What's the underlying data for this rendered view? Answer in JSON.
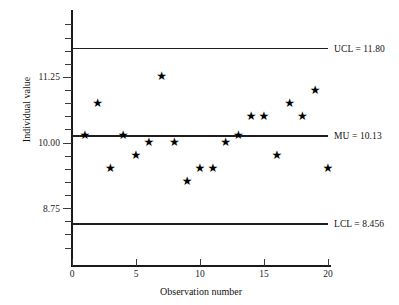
{
  "chart_data": {
    "type": "scatter",
    "title": "",
    "xlabel": "Observation number",
    "ylabel": "Individual value",
    "x": [
      1,
      2,
      3,
      4,
      5,
      6,
      7,
      8,
      9,
      10,
      11,
      12,
      13,
      14,
      15,
      16,
      17,
      18,
      19,
      20
    ],
    "values": [
      10.13,
      10.75,
      9.5,
      10.13,
      9.75,
      10.0,
      11.25,
      10.0,
      9.25,
      9.5,
      9.5,
      10.0,
      10.13,
      10.5,
      10.5,
      9.75,
      10.75,
      10.5,
      11.0,
      9.5
    ],
    "series": [
      {
        "name": "Individual value",
        "values": [
          10.13,
          10.75,
          9.5,
          10.13,
          9.75,
          10.0,
          11.25,
          10.0,
          9.25,
          9.5,
          9.5,
          10.0,
          10.13,
          10.5,
          10.5,
          9.75,
          10.75,
          10.5,
          11.0,
          9.5
        ]
      }
    ],
    "marker": "star",
    "xlim": [
      0,
      20
    ],
    "ylim": [
      8.0,
      12.2
    ],
    "xticks": [
      0,
      5,
      10,
      15,
      20
    ],
    "xticklabels": [
      "0",
      "5",
      "10",
      "15",
      "20"
    ],
    "yticks": [
      8.75,
      10.0,
      11.25
    ],
    "yticklabels": [
      "8.75",
      "10.00",
      "11.25"
    ],
    "grid": false,
    "legend": "none",
    "control_limits": [
      {
        "id": "ucl",
        "name": "UCL",
        "value": 11.8,
        "label": "UCL = 11.80"
      },
      {
        "id": "mu",
        "name": "MU",
        "value": 10.13,
        "label": "MU = 10.13"
      },
      {
        "id": "lcl",
        "name": "LCL",
        "value": 8.456,
        "label": "LCL = 8.456"
      }
    ],
    "marker_glyph": "★",
    "colors": {
      "axis": "#1a1a1a",
      "line": "#1f1f1f",
      "marker": "#000000",
      "background": "#ffffff"
    }
  }
}
